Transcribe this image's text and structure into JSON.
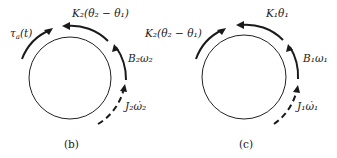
{
  "figure": {
    "panel_b": {
      "caption": "(b)",
      "labels": {
        "torque": "τ",
        "torque_sub": "a",
        "torque_arg": "(t)",
        "spring": "K₂(θ₂ − θ₁)",
        "damper": "B₂ω₂",
        "inertia": "J₂ω̇₂"
      }
    },
    "panel_c": {
      "caption": "(c)",
      "labels": {
        "coupling": "K₂(θ₂ − θ₁)",
        "spring": "K₁θ₁",
        "damper": "B₁ω₁",
        "inertia": "J₁ω̇₁"
      }
    }
  }
}
